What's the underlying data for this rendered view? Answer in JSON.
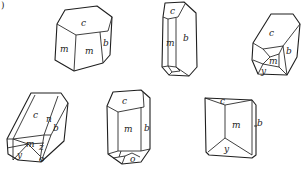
{
  "figure": {
    "panel_label": ")",
    "crystals": [
      {
        "id": 1,
        "faces": [
          "c",
          "m",
          "m",
          "b"
        ]
      },
      {
        "id": 2,
        "faces": [
          "c",
          "m",
          "b"
        ]
      },
      {
        "id": 3,
        "faces": [
          "c",
          "m",
          "b",
          "y"
        ]
      },
      {
        "id": 4,
        "faces": [
          "c",
          "n",
          "b",
          "m",
          "z",
          "y",
          "o"
        ]
      },
      {
        "id": 5,
        "faces": [
          "c",
          "m",
          "b",
          "o"
        ]
      },
      {
        "id": 6,
        "faces": [
          "c",
          "m",
          "b",
          "y"
        ]
      }
    ]
  },
  "labels": {
    "c1_c": "c",
    "c1_m1": "m",
    "c1_m2": "m",
    "c1_b": "b",
    "c2_c": "c",
    "c2_m": "m",
    "c2_b": "b",
    "c3_c": "c",
    "c3_m": "m",
    "c3_b": "b",
    "c3_y": "y",
    "c4_c": "c",
    "c4_n": "n",
    "c4_b": "b",
    "c4_m": "m",
    "c4_z": "z",
    "c4_y": "y",
    "c4_o": "o",
    "c5_c": "c",
    "c5_m": "m",
    "c5_b": "b",
    "c5_o": "o",
    "c6_c": "c",
    "c6_m": "m",
    "c6_b": "b",
    "c6_y": "y"
  }
}
